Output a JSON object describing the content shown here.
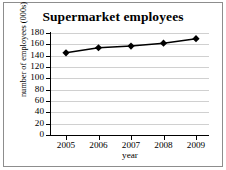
{
  "chart_data": {
    "type": "line",
    "title": "Supermarket employees",
    "xlabel": "year",
    "ylabel": "number of employees (000s)",
    "categories": [
      "2005",
      "2006",
      "2007",
      "2008",
      "2009"
    ],
    "x": [
      2005,
      2006,
      2007,
      2008,
      2009
    ],
    "values": [
      145,
      154,
      157,
      162,
      170
    ],
    "series": [
      {
        "name": "number of employees (000s)",
        "values": [
          145,
          154,
          157,
          162,
          170
        ]
      }
    ],
    "ylim": [
      0,
      180
    ],
    "ytick_labels": [
      "180",
      "160",
      "140",
      "120",
      "100",
      "80",
      "60",
      "40",
      "20",
      "0"
    ],
    "ytick_values": [
      180,
      160,
      140,
      120,
      100,
      80,
      60,
      40,
      20,
      0
    ],
    "ytick_step": 20,
    "grid": true,
    "grid_axis": "y",
    "legend": false,
    "legend_position": "none",
    "marker": "diamond",
    "marker_color": "#000000",
    "line_color": "#000000",
    "grid_color": "#d0d0d0",
    "background_color": "#ffffff"
  }
}
